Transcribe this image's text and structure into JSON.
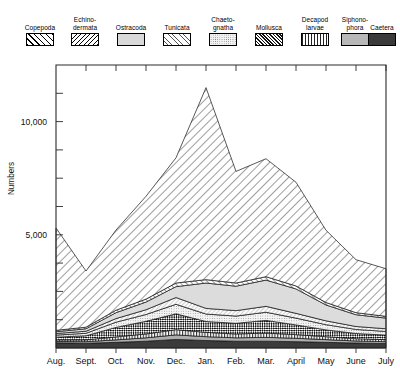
{
  "legend": {
    "items": [
      {
        "label": "Copepoda",
        "pattern": "diagonal-forward",
        "name": "legend-swatch-copepoda"
      },
      {
        "label": "Echino-\ndermata",
        "pattern": "diagonal-back",
        "name": "legend-swatch-echinodermata"
      },
      {
        "label": "Ostracoda",
        "pattern": "solid-light-gray",
        "name": "legend-swatch-ostracoda"
      },
      {
        "label": "Tunicata",
        "pattern": "fine-diagonal",
        "name": "legend-swatch-tunicata"
      },
      {
        "label": "Chaeto-\ngnatha",
        "pattern": "stipple-dots",
        "name": "legend-swatch-chaetognatha"
      },
      {
        "label": "Mollusca",
        "pattern": "checkerboard",
        "name": "legend-swatch-mollusca"
      },
      {
        "label": "Decapod\nlarvae",
        "pattern": "vertical-lines",
        "name": "legend-swatch-decapod-larvae"
      },
      {
        "label": "Siphono-\nphora",
        "pattern": "fine-stipple-gray",
        "name": "legend-swatch-siphonophora"
      },
      {
        "label": "Caetera",
        "pattern": "solid-dark",
        "name": "legend-swatch-caetera"
      }
    ]
  },
  "chart_data": {
    "type": "area",
    "stacked": true,
    "title": "",
    "xlabel": "",
    "ylabel": "Numbers",
    "ylim": [
      0,
      12500
    ],
    "yticks": [
      0,
      1250,
      2500,
      3750,
      5000,
      6250,
      7500,
      8750,
      10000,
      11250
    ],
    "ytick_labels": {
      "5000": "5,000",
      "10000": "10,000"
    },
    "grid": false,
    "legend_position": "top",
    "categories": [
      "Aug.",
      "Sept.",
      "Oct.",
      "Nov.",
      "Dec.",
      "Jan.",
      "Feb.",
      "Mar.",
      "April",
      "May",
      "June",
      "July"
    ],
    "series": [
      {
        "name": "Caetera",
        "values": [
          230,
          210,
          250,
          300,
          380,
          330,
          300,
          300,
          280,
          250,
          220,
          200
        ]
      },
      {
        "name": "Siphonophora",
        "values": [
          60,
          70,
          110,
          150,
          200,
          170,
          150,
          170,
          150,
          120,
          90,
          80
        ]
      },
      {
        "name": "Decapod larvae",
        "values": [
          70,
          80,
          130,
          170,
          230,
          190,
          170,
          190,
          160,
          130,
          100,
          90
        ]
      },
      {
        "name": "Mollusca",
        "values": [
          120,
          180,
          420,
          560,
          700,
          480,
          470,
          560,
          430,
          300,
          230,
          200
        ]
      },
      {
        "name": "Chaetognatha",
        "values": [
          90,
          110,
          230,
          300,
          420,
          330,
          320,
          360,
          300,
          230,
          180,
          160
        ]
      },
      {
        "name": "Tunicata",
        "values": [
          70,
          90,
          160,
          210,
          300,
          250,
          240,
          260,
          210,
          170,
          130,
          120
        ]
      },
      {
        "name": "Ostracoda",
        "values": [
          80,
          110,
          260,
          340,
          480,
          1120,
          1080,
          1160,
          1080,
          700,
          520,
          470
        ]
      },
      {
        "name": "Echinodermata",
        "values": [
          60,
          70,
          110,
          130,
          160,
          150,
          140,
          150,
          130,
          110,
          90,
          80
        ]
      },
      {
        "name": "Copepoda",
        "values": [
          4520,
          2480,
          3540,
          4540,
          5530,
          8480,
          4930,
          5210,
          4580,
          3190,
          2340,
          2100
        ]
      }
    ],
    "peak_annotations": [
      {
        "category": "Jan.",
        "total": 11520
      },
      {
        "category": "Mar.",
        "total": 8360
      },
      {
        "category": "Aug.",
        "total": 5300
      }
    ]
  }
}
